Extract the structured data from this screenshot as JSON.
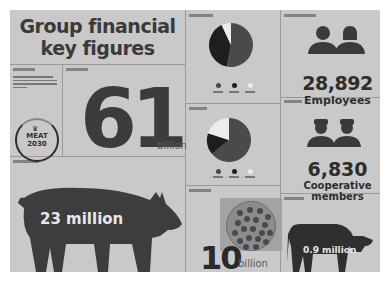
{
  "title": {
    "line1": "Group financial",
    "line2": "key figures"
  },
  "sections": {
    "sustainability": {
      "badge_line1": "MEAT",
      "badge_line2": "2030",
      "icon": "crown-icon"
    },
    "revenue": {
      "value": "61",
      "unit": "billion"
    },
    "pigs": {
      "value": "23 million",
      "icon": "pig-icon"
    },
    "share_chart_1": {
      "icon": "pie-chart-icon"
    },
    "share_chart_2": {
      "icon": "pie-chart-icon"
    },
    "meatballs": {
      "value": "10",
      "unit": "billion",
      "icon": "meatball-plate-icon"
    },
    "employees": {
      "value": "28,892",
      "label": "Employees",
      "icon": "people-icon"
    },
    "cooperative": {
      "value": "6,830",
      "label_line1": "Cooperative",
      "label_line2": "members",
      "icon": "farmers-icon"
    },
    "cattle": {
      "value": "0.9 million",
      "icon": "cow-icon"
    }
  },
  "colors": {
    "background": "#c9c9c9",
    "ink": "#2e2e2e",
    "slice_dark": "#4a4a4a",
    "slice_black": "#1e1e1e",
    "slice_white": "#ececec"
  },
  "chart_data": [
    {
      "type": "pie",
      "title": "",
      "slices": [
        {
          "name": "series-a",
          "value": 53,
          "color": "#4a4a4a"
        },
        {
          "name": "series-b",
          "value": 40,
          "color": "#1e1e1e"
        },
        {
          "name": "series-c",
          "value": 7,
          "color": "#ececec"
        }
      ],
      "legend": "bottom"
    },
    {
      "type": "pie",
      "title": "",
      "slices": [
        {
          "name": "series-a",
          "value": 64,
          "color": "#4a4a4a"
        },
        {
          "name": "series-b",
          "value": 16,
          "color": "#1e1e1e"
        },
        {
          "name": "series-c",
          "value": 20,
          "color": "#ececec"
        }
      ],
      "legend": "bottom"
    }
  ]
}
